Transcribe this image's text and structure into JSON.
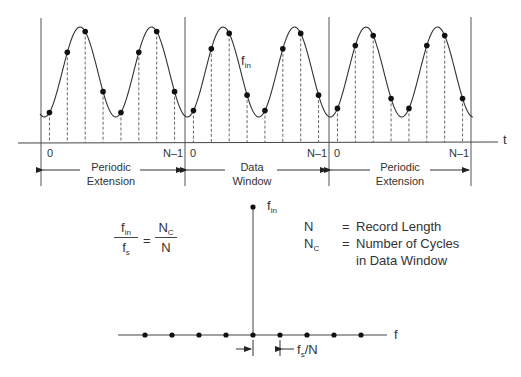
{
  "time_domain": {
    "axis_label": "t",
    "signal_label": "f",
    "signal_label_sub": "in",
    "windows": [
      {
        "name": "periodic-extension-left",
        "label_line1": "Periodic",
        "label_line2": "Extension",
        "start_index": "0",
        "end_index": "N–1"
      },
      {
        "name": "data-window",
        "label_line1": "Data",
        "label_line2": "Window",
        "start_index": "0",
        "end_index": "N–1"
      },
      {
        "name": "periodic-extension-right",
        "label_line1": "Periodic",
        "label_line2": "Extension",
        "start_index": "0",
        "end_index": "N–1"
      }
    ],
    "cycles_per_window": 2,
    "samples_per_window": 8
  },
  "frequency_domain": {
    "axis_label": "f",
    "spike_label": "f",
    "spike_label_sub": "in",
    "bin_spacing_label_main": "f",
    "bin_spacing_label_sub": "s",
    "bin_spacing_label_tail": "/N",
    "bin_count": 9,
    "spike_bin_index": 4
  },
  "equation": {
    "lhs_num": "f",
    "lhs_num_sub": "in",
    "lhs_den": "f",
    "lhs_den_sub": "s",
    "equals": "=",
    "rhs_num": "N",
    "rhs_num_sub": "C",
    "rhs_den": "N"
  },
  "legend": {
    "items": [
      {
        "key": "N",
        "key_sub": "",
        "eq": "=",
        "text": "Record Length"
      },
      {
        "key": "N",
        "key_sub": "C",
        "eq": "=",
        "text": "Number of Cycles"
      },
      {
        "key": "",
        "key_sub": "",
        "eq": "",
        "text": "in Data Window"
      }
    ]
  },
  "colors": {
    "line": "#3a3a3a",
    "dot": "#111111",
    "text": "#333333"
  }
}
